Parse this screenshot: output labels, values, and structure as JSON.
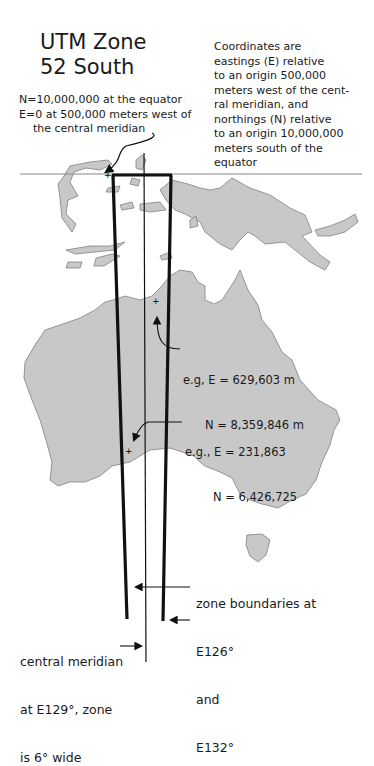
{
  "title": {
    "line1": "UTM Zone",
    "line2": "52 South"
  },
  "equator_note": {
    "line1": "N=10,000,000 at the equator",
    "line2": "E=0 at 500,000 meters west of",
    "line3": "the central meridian"
  },
  "coords_note": {
    "lines": [
      "Coordinates are",
      "eastings (E) relative",
      "to an origin 500,000",
      "meters west of the cent-",
      "ral meridian, and",
      "northings (N) relative",
      "to an origin 10,000,000",
      "meters south of the",
      "equator"
    ]
  },
  "example1": {
    "e": "e.g, E = 629,603 m",
    "n": "N = 8,359,846 m"
  },
  "example2": {
    "e": "e.g., E = 231,863",
    "n": "N = 6,426,725"
  },
  "zone_boundaries": {
    "line1": "zone boundaries at",
    "west": "E126°",
    "and": "and",
    "east": "E132°"
  },
  "central_meridian": {
    "line1": "central meridian",
    "line2": "at E129°, zone",
    "line3": "is 6° wide"
  },
  "colors": {
    "land": "#c8c8c8",
    "coast": "#808080",
    "lines": "#111111"
  }
}
